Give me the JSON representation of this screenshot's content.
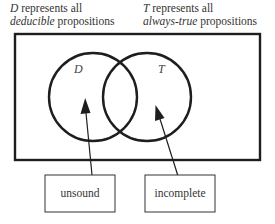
{
  "captions": {
    "left": {
      "symbol": "D",
      "line1_rest": " represents all",
      "emphasis": "deducible",
      "line2_rest": " propositions"
    },
    "right": {
      "symbol": "T",
      "line1_rest": " represents all",
      "emphasis": "always-true",
      "line2_rest": " propositions"
    }
  },
  "venn": {
    "sets": [
      {
        "label": "D",
        "cx": 93,
        "cy": 97,
        "r": 44
      },
      {
        "label": "T",
        "cx": 147,
        "cy": 97,
        "r": 44
      }
    ],
    "stroke_color": "#1e1e1e"
  },
  "annotations": [
    {
      "label": "unsound",
      "points_to": "D only (deducible but not always-true)"
    },
    {
      "label": "incomplete",
      "points_to": "T only (always-true but not deducible)"
    }
  ],
  "colors": {
    "line": "#1e1e1e",
    "text": "#333333",
    "background": "#ffffff"
  }
}
